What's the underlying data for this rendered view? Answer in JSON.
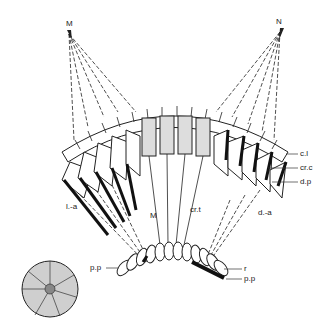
{
  "diagram": {
    "type": "compound eye ommatidia schematic",
    "points": {
      "left_source": "M",
      "right_source": "N",
      "focal_left": "M"
    },
    "labels": {
      "corneal_lens": "c.l",
      "crystalline_cone": "cr.c",
      "distal_pigment": "d.p",
      "crystalline_tract": "cr.t",
      "rhabdom": "r",
      "proximal_pigment_left": "p.p",
      "proximal_pigment_right": "p.p",
      "light_adapted": "l.-a",
      "dark_adapted": "d.-a"
    },
    "inset": "cross-section of ommatidium with radial rhabdomeres"
  }
}
